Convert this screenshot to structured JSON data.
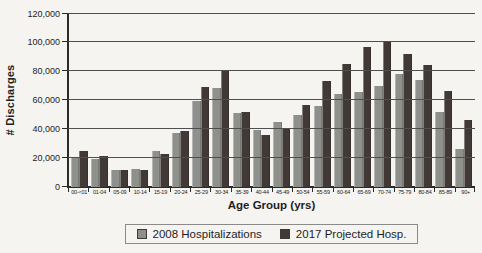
{
  "colors": {
    "background": "#f5f4f1",
    "bar_2008": "#8e908c",
    "bar_2017": "#413935",
    "axis": "#2b2b2b",
    "gridline": "#4f4f4f",
    "text": "#1e1e1e",
    "legend_border": "#8a8a8a"
  },
  "chart_data": {
    "type": "bar",
    "title": "",
    "xlabel": "Age Group (yrs)",
    "ylabel": "# Discharges",
    "ylim": [
      0,
      120000
    ],
    "ytick_step": 20000,
    "ytick_labels": [
      "0",
      "20,000",
      "40,000",
      "60,000",
      "80,000",
      "100,000",
      "120,000"
    ],
    "grid": true,
    "legend_position": "bottom",
    "categories": [
      "00-<01",
      "01-04",
      "05-09",
      "10-14",
      "15-19",
      "20-24",
      "25-29",
      "30-34",
      "35-39",
      "40-44",
      "45-49",
      "50-54",
      "55-59",
      "60-64",
      "65-69",
      "70-74",
      "75-79",
      "80-84",
      "85-89",
      "90+"
    ],
    "series": [
      {
        "name": "2008 Hospitalizations",
        "color_key": "bar_2008",
        "values": [
          21000,
          19500,
          11500,
          12500,
          24500,
          37000,
          59000,
          68000,
          51000,
          39000,
          44500,
          50000,
          56000,
          64000,
          65500,
          70000,
          78000,
          74000,
          51500,
          26500
        ]
      },
      {
        "name": "2017 Projected Hosp.",
        "color_key": "bar_2017",
        "values": [
          24500,
          21500,
          11500,
          11500,
          22500,
          38500,
          69000,
          80000,
          52000,
          36000,
          41000,
          56500,
          73000,
          84500,
          96500,
          100000,
          91500,
          84000,
          66000,
          46000
        ]
      }
    ]
  }
}
